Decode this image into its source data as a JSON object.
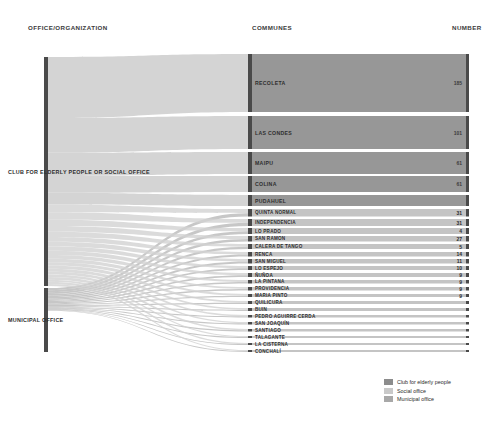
{
  "headers": {
    "office": "OFFICE/ORGANIZATION",
    "communes": "COMMUNES",
    "number": "NUMBER"
  },
  "sources": [
    {
      "label": "CLUB FOR ELDERLY PEOPLE OR SOCIAL OFFICE",
      "total": 520
    },
    {
      "label": "MUNICIPAL OFFICE",
      "total": 180
    }
  ],
  "legend": [
    {
      "label": "Club for elderly people",
      "color": "#8c8c8c"
    },
    {
      "label": "Social office",
      "color": "#c9c9c9"
    },
    {
      "label": "Municipal office",
      "color": "#a8a8a8"
    }
  ],
  "colors": {
    "node_dark": "#4a4a4a",
    "band_dark": "#8e8e8e",
    "band_light": "#d2d2d2",
    "band_mid": "#b4b4b4",
    "text": "#2b2b2b"
  },
  "chart_data": {
    "type": "sankey",
    "title": "",
    "xlabel": "",
    "ylabel": "",
    "grid": false,
    "legend_position": "bottom-right",
    "source_nodes": [
      "CLUB FOR ELDERLY PEOPLE OR SOCIAL OFFICE",
      "MUNICIPAL OFFICE"
    ],
    "categories": [
      "RECOLETA",
      "LAS CONDES",
      "MAIPU",
      "COLINA",
      "PUDAHUEL",
      "QUINTA NORMAL",
      "INDEPENDENCIA",
      "LO PRADO",
      "SAN RAMON",
      "CALERA DE TANGO",
      "RENCA",
      "SAN MIGUEL",
      "LO ESPEJO",
      "ÑUÑOA",
      "LA PINTANA",
      "PROVIDENCIA",
      "MARIA PINTO",
      "QUILICURA",
      "BUIN",
      "PEDRO AGUIRRE CERDA",
      "SAN JOAQUÍN",
      "SANTIAGO",
      "TALAGANTE",
      "LA CISTERNA",
      "CONCHALÍ"
    ],
    "values": [
      185,
      101,
      61,
      61,
      31,
      31,
      31,
      4,
      27,
      5,
      14,
      8,
      11,
      10,
      9,
      9,
      9,
      9,
      6,
      5,
      4,
      4,
      3,
      3,
      2
    ],
    "labeled_values": {
      "RECOLETA": 185,
      "LAS CONDES": 101,
      "MAIPU": 61,
      "COLINA": 61,
      "QUINTA NORMAL": 31,
      "INDEPENDENCIA": 31,
      "LO PRADO": 4,
      "SAN RAMON": 27,
      "CALERA DE TANGO": 5,
      "RENCA": 14,
      "SAN MIGUEL": 11,
      "LO ESPEJO": 10,
      "ÑUÑOA": 9,
      "LA PINTANA": 9,
      "PROVIDENCIA": 9,
      "MARIA PINTO": 9
    }
  },
  "nodes": [
    {
      "name": "RECOLETA",
      "y": 54,
      "h": 58,
      "num": "185",
      "numOnDark": true,
      "size": "big"
    },
    {
      "name": "LAS CONDES",
      "y": 116,
      "h": 33,
      "num": "101",
      "numOnDark": true,
      "size": "big"
    },
    {
      "name": "MAIPU",
      "y": 152,
      "h": 22,
      "num": "61",
      "numOnDark": true,
      "size": "big"
    },
    {
      "name": "COLINA",
      "y": 176,
      "h": 16,
      "num": "61",
      "numOnDark": true,
      "size": "big"
    },
    {
      "name": "PUDAHUEL",
      "y": 195,
      "h": 11,
      "num": "",
      "numOnDark": false,
      "size": "big"
    },
    {
      "name": "QUINTA NORMAL",
      "y": 209,
      "h": 7.5,
      "num": "31",
      "numOnDark": false,
      "size": "sm"
    },
    {
      "name": "INDEPENDENCIA",
      "y": 219,
      "h": 7,
      "num": "31",
      "numOnDark": false,
      "size": "sm"
    },
    {
      "name": "LO PRADO",
      "y": 228,
      "h": 6,
      "num": "4",
      "numOnDark": false,
      "size": "sm"
    },
    {
      "name": "SAN RAMON",
      "y": 236,
      "h": 5.5,
      "num": "27",
      "numOnDark": false,
      "size": "sm"
    },
    {
      "name": "CALERA DE TANGO",
      "y": 244,
      "h": 5,
      "num": "5",
      "numOnDark": false,
      "size": "sm"
    },
    {
      "name": "RENCA",
      "y": 252,
      "h": 4.5,
      "num": "14",
      "numOnDark": false,
      "size": "sm"
    },
    {
      "name": "SAN MIGUEL",
      "y": 259,
      "h": 4.5,
      "num": "11",
      "numOnDark": false,
      "size": "sm"
    },
    {
      "name": "LO ESPEJO",
      "y": 266,
      "h": 4,
      "num": "10",
      "numOnDark": false,
      "size": "sm"
    },
    {
      "name": "ÑUÑOA",
      "y": 273,
      "h": 4,
      "num": "9",
      "numOnDark": false,
      "size": "sm"
    },
    {
      "name": "LA PINTANA",
      "y": 280,
      "h": 3.5,
      "num": "9",
      "numOnDark": false,
      "size": "sm"
    },
    {
      "name": "PROVIDENCIA",
      "y": 287,
      "h": 3.5,
      "num": "9",
      "numOnDark": false,
      "size": "sm"
    },
    {
      "name": "MARIA PINTO",
      "y": 294,
      "h": 3,
      "num": "9",
      "numOnDark": false,
      "size": "sm"
    },
    {
      "name": "QUILICURA",
      "y": 301,
      "h": 3,
      "num": "",
      "numOnDark": false,
      "size": "sm"
    },
    {
      "name": "BUIN",
      "y": 308,
      "h": 3,
      "num": "",
      "numOnDark": false,
      "size": "sm"
    },
    {
      "name": "PEDRO AGUIRRE CERDA",
      "y": 315,
      "h": 2.5,
      "num": "",
      "numOnDark": false,
      "size": "sm"
    },
    {
      "name": "SAN JOAQUÍN",
      "y": 322,
      "h": 2.5,
      "num": "",
      "numOnDark": false,
      "size": "sm"
    },
    {
      "name": "SANTIAGO",
      "y": 329,
      "h": 2.5,
      "num": "",
      "numOnDark": false,
      "size": "sm"
    },
    {
      "name": "TALAGANTE",
      "y": 336,
      "h": 2,
      "num": "",
      "numOnDark": false,
      "size": "sm"
    },
    {
      "name": "LA CISTERNA",
      "y": 343,
      "h": 2,
      "num": "",
      "numOnDark": false,
      "size": "sm"
    },
    {
      "name": "CONCHALÍ",
      "y": 350,
      "h": 2,
      "num": "",
      "numOnDark": false,
      "size": "sm"
    }
  ]
}
